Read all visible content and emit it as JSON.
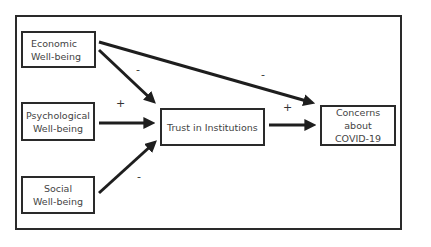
{
  "diagram": {
    "nodes": [
      {
        "id": "economic",
        "lines": [
          "Economic",
          "Well-being"
        ]
      },
      {
        "id": "psychological",
        "lines": [
          "Psychological",
          "Well-being"
        ]
      },
      {
        "id": "social",
        "lines": [
          "Social",
          "Well-being"
        ]
      },
      {
        "id": "trust",
        "lines": [
          "Trust in Institutions"
        ]
      },
      {
        "id": "concerns",
        "lines": [
          "Concerns about",
          "COVID-19"
        ]
      }
    ],
    "edges": [
      {
        "from": "economic",
        "to": "trust",
        "sign": "-"
      },
      {
        "from": "psychological",
        "to": "trust",
        "sign": "+"
      },
      {
        "from": "social",
        "to": "trust",
        "sign": "-"
      },
      {
        "from": "economic",
        "to": "concerns",
        "sign": "-"
      },
      {
        "from": "trust",
        "to": "concerns",
        "sign": "+"
      }
    ]
  }
}
